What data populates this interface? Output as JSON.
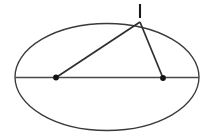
{
  "figure": {
    "canvas": {
      "width": 212,
      "height": 139,
      "background": "#ffffff"
    },
    "colors": {
      "outline": "#3a3a3a",
      "axis": "#4a4a4a",
      "chord": "#2e2e2e",
      "dot": "#141414",
      "tick": "#1a1a1a"
    },
    "ellipse": {
      "label": "ellipse-outline",
      "cx": 107,
      "cy": 77,
      "rx": 92,
      "ry": 53.5,
      "stroke_width": 1.35
    },
    "major_axis": {
      "label": "major-axis",
      "x1": 15,
      "y1": 77.5,
      "x2": 199,
      "y2": 77.5,
      "stroke_width": 1.6
    },
    "apex": {
      "label": "apex-point",
      "x": 140,
      "y": 22
    },
    "focus_left": {
      "label": "left-focus-point",
      "x": 56,
      "y": 77.5,
      "r": 2.9
    },
    "focus_right": {
      "label": "right-focus-point",
      "x": 163,
      "y": 78,
      "r": 2.9
    },
    "chord_left": {
      "label": "left-focal-chord",
      "x1": 56,
      "y1": 77.5,
      "x2": 140,
      "y2": 22,
      "stroke_width": 1.7
    },
    "chord_right": {
      "label": "right-focal-chord",
      "x1": 163,
      "y1": 78,
      "x2": 140,
      "y2": 22,
      "stroke_width": 1.7
    },
    "tick_mark": {
      "label": "apex-tick-mark",
      "x1": 140,
      "y1": 4,
      "x2": 140,
      "y2": 18,
      "stroke_width": 2.1
    }
  },
  "chart_data": {
    "type": "scatter",
    "xlabel": "",
    "ylabel": "",
    "xlim": [
      0,
      212
    ],
    "ylim": [
      0,
      139
    ],
    "grid": false,
    "legend": null,
    "annotations": [
      "short vertical tick mark above the apex point"
    ],
    "shapes": [
      {
        "name": "ellipse",
        "type": "ellipse",
        "center": [
          107,
          77
        ],
        "radii": [
          92,
          53.5
        ]
      },
      {
        "name": "major-axis-segment",
        "type": "line",
        "points": [
          [
            15,
            77.5
          ],
          [
            199,
            77.5
          ]
        ]
      },
      {
        "name": "left-focus-to-apex",
        "type": "line",
        "points": [
          [
            56,
            77.5
          ],
          [
            140,
            22
          ]
        ]
      },
      {
        "name": "right-focus-to-apex",
        "type": "line",
        "points": [
          [
            163,
            78
          ],
          [
            140,
            22
          ]
        ]
      },
      {
        "name": "apex-tick",
        "type": "line",
        "points": [
          [
            140,
            4
          ],
          [
            140,
            18
          ]
        ]
      }
    ],
    "points": [
      {
        "name": "left-focus",
        "x": 56,
        "y": 77.5,
        "marker": "filled-dot"
      },
      {
        "name": "right-focus",
        "x": 163,
        "y": 78,
        "marker": "filled-dot"
      },
      {
        "name": "apex",
        "x": 140,
        "y": 22,
        "marker": "vertex"
      }
    ]
  }
}
